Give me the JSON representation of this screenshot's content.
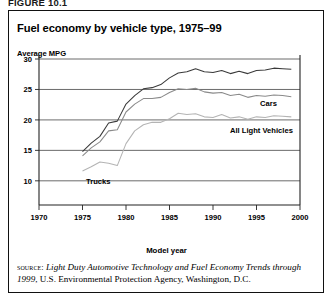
{
  "figure_number": "FIGURE 10.1",
  "chart": {
    "title": "Fuel economy by vehicle type, 1975–99",
    "y_unit_label": "Average MPG",
    "x_axis_title": "Model year"
  },
  "source": {
    "lead": "source:",
    "title_italic": "Light Duty Automotive Technology and Fuel Economy Trends through 1999",
    "rest": ", U.S. Environmental Protection Agency, Washington, D.C."
  },
  "chart_data": {
    "type": "line",
    "title": "Fuel economy by vehicle type, 1975–99",
    "xlabel": "Model year",
    "ylabel": "Average MPG",
    "xlim": [
      1970,
      2000
    ],
    "ylim": [
      8,
      30
    ],
    "xticks": [
      1970,
      1975,
      1980,
      1985,
      1990,
      1995,
      2000
    ],
    "yticks": [
      10,
      15,
      20,
      25,
      30
    ],
    "grid": "horizontal",
    "legend_position": "inline-right",
    "series": [
      {
        "name": "Cars",
        "color": "#3a3a3a",
        "x": [
          1975,
          1976,
          1977,
          1978,
          1979,
          1980,
          1981,
          1982,
          1983,
          1984,
          1985,
          1986,
          1987,
          1988,
          1989,
          1990,
          1991,
          1992,
          1993,
          1994,
          1995,
          1996,
          1997,
          1998,
          1999
        ],
        "values": [
          14.8,
          16.2,
          17.3,
          19.5,
          19.8,
          22.6,
          24.0,
          25.1,
          25.3,
          25.8,
          26.9,
          27.7,
          27.9,
          28.4,
          27.9,
          27.8,
          28.1,
          27.6,
          28.0,
          27.6,
          28.1,
          28.2,
          28.5,
          28.4,
          28.3
        ]
      },
      {
        "name": "All Light Vehicles",
        "color": "#8a8a8a",
        "x": [
          1975,
          1976,
          1977,
          1978,
          1979,
          1980,
          1981,
          1982,
          1983,
          1984,
          1985,
          1986,
          1987,
          1988,
          1989,
          1990,
          1991,
          1992,
          1993,
          1994,
          1995,
          1996,
          1997,
          1998,
          1999
        ],
        "values": [
          14.1,
          15.4,
          16.4,
          18.2,
          18.4,
          21.3,
          22.6,
          23.5,
          23.5,
          23.7,
          24.5,
          25.1,
          25.0,
          25.2,
          24.6,
          24.4,
          24.5,
          24.0,
          24.2,
          23.7,
          24.0,
          23.9,
          24.1,
          24.0,
          23.8
        ]
      },
      {
        "name": "Trucks",
        "color": "#b4b4b4",
        "x": [
          1975,
          1976,
          1977,
          1978,
          1979,
          1980,
          1981,
          1982,
          1983,
          1984,
          1985,
          1986,
          1987,
          1988,
          1989,
          1990,
          1991,
          1992,
          1993,
          1994,
          1995,
          1996,
          1997,
          1998,
          1999
        ],
        "values": [
          11.6,
          12.3,
          13.1,
          12.9,
          12.5,
          16.1,
          18.2,
          19.2,
          19.6,
          19.6,
          20.2,
          21.1,
          20.9,
          21.0,
          20.5,
          20.4,
          20.9,
          20.3,
          20.5,
          20.1,
          20.5,
          20.4,
          20.7,
          20.6,
          20.5
        ]
      }
    ]
  }
}
